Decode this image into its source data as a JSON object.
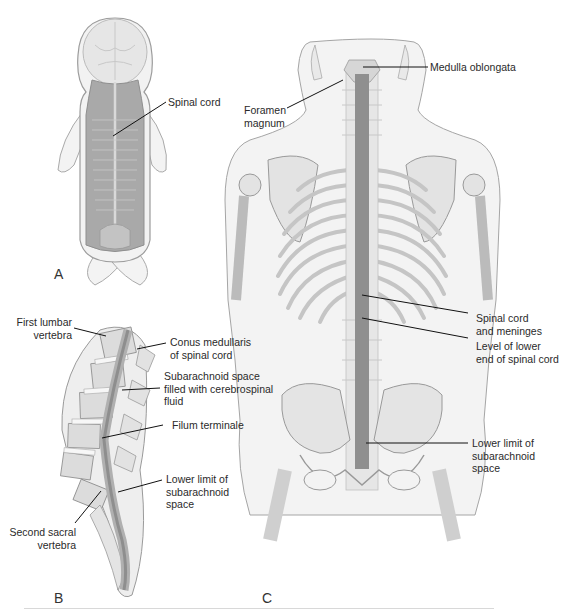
{
  "figure": {
    "panels": [
      {
        "id": "A",
        "label": "A",
        "description": "Embryo dorsal view with spinal cord"
      },
      {
        "id": "B",
        "label": "B",
        "description": "Sagittal section of lumbosacral vertebral column"
      },
      {
        "id": "C",
        "label": "C",
        "description": "Adult posterior view of spinal cord within skeleton"
      }
    ],
    "labels": {
      "a_spinal_cord": "Spinal cord",
      "b_first_lumbar_1": "First lumbar",
      "b_first_lumbar_2": "vertebra",
      "b_conus_1": "Conus medullaris",
      "b_conus_2": "of spinal cord",
      "b_subarachnoid_1": "Subarachnoid space",
      "b_subarachnoid_2": "filled with cerebrospinal",
      "b_subarachnoid_3": "fluid",
      "b_filum": "Filum terminale",
      "b_lower_limit_1": "Lower limit of",
      "b_lower_limit_2": "subarachnoid",
      "b_lower_limit_3": "space",
      "b_second_sacral_1": "Second sacral",
      "b_second_sacral_2": "vertebra",
      "c_medulla": "Medulla oblongata",
      "c_foramen_1": "Foramen",
      "c_foramen_2": "magnum",
      "c_cord_meninges_1": "Spinal cord",
      "c_cord_meninges_2": "and meninges",
      "c_level_lower_1": "Level of lower",
      "c_level_lower_2": "end of spinal cord",
      "c_lower_limit_1": "Lower limit of",
      "c_lower_limit_2": "subarachnoid",
      "c_lower_limit_3": "space"
    },
    "colors": {
      "bone": "#e9e9e9",
      "bone_outline": "#9a9a9a",
      "cord": "#8e8e8e",
      "body_fill": "#f4f4f4",
      "leader": "#111111"
    }
  }
}
